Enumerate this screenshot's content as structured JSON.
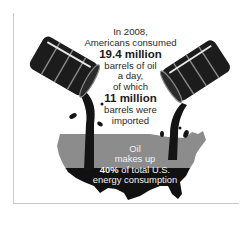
{
  "headline": {
    "line1": "In 2008,",
    "line2": "Americans consumed",
    "stat1": "19.4 million",
    "line3": "barrels of oil",
    "line4": "a day,",
    "line5": "of which",
    "stat2": "11 million",
    "line6": "barrels were",
    "line7": "imported"
  },
  "map_caption": {
    "line1": "Oil",
    "line2": "makes up",
    "pct": "40%",
    "line3_rest": " of total U.S.",
    "line4": "energy consumption"
  },
  "icons": {
    "left": "oil-barrel-icon",
    "right": "oil-barrel-icon",
    "map": "us-map-icon"
  },
  "colors": {
    "barrel": "#1c1c1c",
    "barrel_stripe": "#8a8a8a",
    "map_gray": "#8c8c8c",
    "map_black": "#111111",
    "oil": "#141414"
  }
}
